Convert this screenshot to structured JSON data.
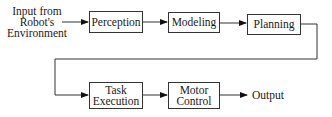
{
  "diagram": {
    "input_label": [
      "Input from",
      "Robot's",
      "Environment"
    ],
    "stages": [
      {
        "id": "perception",
        "label": [
          "Perception"
        ]
      },
      {
        "id": "modeling",
        "label": [
          "Modeling"
        ]
      },
      {
        "id": "planning",
        "label": [
          "Planning"
        ]
      },
      {
        "id": "task-execution",
        "label": [
          "Task",
          "Execution"
        ]
      },
      {
        "id": "motor-control",
        "label": [
          "Motor",
          "Control"
        ]
      }
    ],
    "output_label": "Output"
  }
}
